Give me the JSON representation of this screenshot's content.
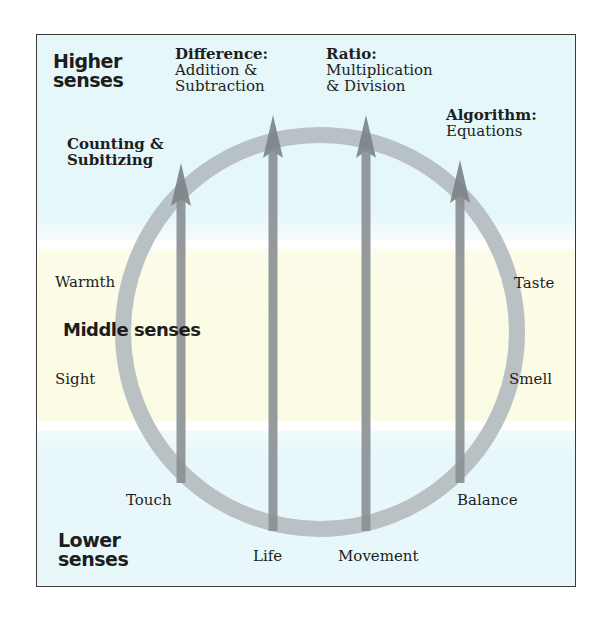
{
  "diagram": {
    "colors": {
      "frame_border": "#3a3a3a",
      "higher_band": "#e6f7fa",
      "middle_band": "#fcfbe4",
      "lower_band": "#e8f8fa",
      "ring": "#b4bcc0",
      "arrow": "#8a8f92",
      "text": "#1d1d1d"
    },
    "sections": {
      "higher": {
        "line1": "Higher",
        "line2": "senses"
      },
      "middle": {
        "label": "Middle senses"
      },
      "lower": {
        "line1": "Lower",
        "line2": "senses"
      }
    },
    "senses": {
      "warmth": "Warmth",
      "sight": "Sight",
      "taste": "Taste",
      "smell": "Smell",
      "touch": "Touch",
      "life": "Life",
      "movement": "Movement",
      "balance": "Balance"
    },
    "operations": [
      {
        "title": "Counting &",
        "subtitle": "Subitizing"
      },
      {
        "title": "Difference:",
        "line2": "Addition &",
        "line3": "Subtraction"
      },
      {
        "title": "Ratio:",
        "line2": "Multiplication",
        "line3": "& Division"
      },
      {
        "title": "Algorithm:",
        "line2": "Equations"
      }
    ],
    "ring": {
      "cx": 320,
      "cy": 332,
      "r": 197,
      "stroke_width": 16
    },
    "arrows": [
      {
        "x": 181,
        "tip_y": 163,
        "bottom_y": 483,
        "from": "Touch",
        "to": "Counting & Subitizing"
      },
      {
        "x": 273,
        "tip_y": 115,
        "bottom_y": 531,
        "from": "Life",
        "to": "Difference"
      },
      {
        "x": 366,
        "tip_y": 115,
        "bottom_y": 531,
        "from": "Movement",
        "to": "Ratio"
      },
      {
        "x": 460,
        "tip_y": 160,
        "bottom_y": 483,
        "from": "Balance",
        "to": "Algorithm"
      }
    ]
  }
}
